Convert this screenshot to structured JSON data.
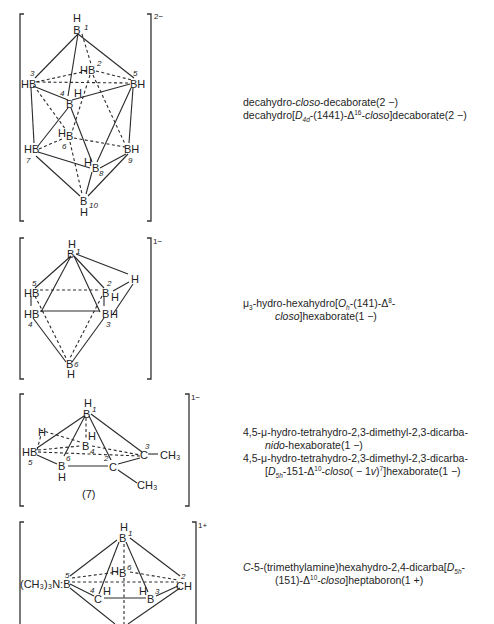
{
  "structures": [
    {
      "id": "decaborate",
      "charge": "2−",
      "atoms": {
        "b1": {
          "label": "B",
          "h": "H",
          "num": "1"
        },
        "b2": {
          "label": "B",
          "h": "H",
          "num": "2"
        },
        "b3": {
          "label": "HB",
          "num": "3"
        },
        "b4": {
          "label": "B",
          "h": "H",
          "num": "4"
        },
        "b5": {
          "label": "BH",
          "num": "5"
        },
        "b6": {
          "label": "B",
          "h": "H",
          "num": "6"
        },
        "b7": {
          "label": "HB",
          "num": "7"
        },
        "b8": {
          "label": "B",
          "h": "H",
          "num": "8"
        },
        "b9": {
          "label": "BH",
          "num": "9"
        },
        "b10": {
          "label": "B",
          "h": "H",
          "num": "10"
        }
      },
      "names": [
        {
          "parts": [
            {
              "t": "decahydro-"
            },
            {
              "t": "closo",
              "i": true
            },
            {
              "t": "-decaborate(2 −)"
            }
          ]
        },
        {
          "parts": [
            {
              "t": "decahydro["
            },
            {
              "t": "D",
              "i": true
            },
            {
              "t": "4d",
              "sub": true,
              "i": true
            },
            {
              "t": "-(1441)-Δ"
            },
            {
              "t": "16",
              "sup": true
            },
            {
              "t": "-"
            },
            {
              "t": "closo",
              "i": true
            },
            {
              "t": "]decaborate(2 −)"
            }
          ]
        }
      ]
    },
    {
      "id": "hexaborate",
      "charge": "1−",
      "atoms": {
        "b1": {
          "label": "B",
          "h": "H",
          "num": "1"
        },
        "b2": {
          "label": "B",
          "h": "H",
          "num": "2"
        },
        "b3": {
          "label": "B",
          "h": "H",
          "num": "3"
        },
        "b4": {
          "label": "HB",
          "num": "4"
        },
        "b5": {
          "label": "HB",
          "num": "5"
        },
        "b6": {
          "label": "B",
          "h": "H",
          "num": "6"
        },
        "mu_h": {
          "label": "H"
        }
      },
      "names": [
        {
          "parts": [
            {
              "t": "μ"
            },
            {
              "t": "3",
              "sub": true
            },
            {
              "t": "-hydro-hexahydro["
            },
            {
              "t": "O",
              "i": true
            },
            {
              "t": "h",
              "sub": true,
              "i": true
            },
            {
              "t": "-(141)-Δ"
            },
            {
              "t": "8",
              "sup": true
            },
            {
              "t": "-"
            }
          ]
        },
        {
          "parts": [
            {
              "t": "closo",
              "i": true
            },
            {
              "t": "]hexaborate(1 −)"
            }
          ]
        }
      ]
    },
    {
      "id": "dicarba-hexaborate",
      "charge": "1−",
      "caption": "(7)",
      "atoms": {
        "b1": {
          "label": "B",
          "h": "H",
          "num": "1"
        },
        "c2": {
          "label": "C",
          "num": "2",
          "sub": "CH₃"
        },
        "c3": {
          "label": "C",
          "num": "3",
          "sub": "CH₃"
        },
        "b4": {
          "label": "B",
          "h": "H",
          "num": "4"
        },
        "b5": {
          "label": "HB",
          "num": "5"
        },
        "b6": {
          "label": "B",
          "h": "H",
          "num": "6"
        },
        "mu_h": {
          "label": "H"
        }
      },
      "names": [
        {
          "parts": [
            {
              "t": "4,5-μ-hydro-tetrahydro-2,3-dimethyl-2,3-dicarba-"
            }
          ]
        },
        {
          "parts": [
            {
              "t": "nido",
              "i": true
            },
            {
              "t": "-hexaborate(1 −)"
            }
          ]
        },
        {
          "parts": [
            {
              "t": "4,5-μ-hydro-tetrahydro-2,3-dimethyl-2,3-dicarba-"
            }
          ]
        },
        {
          "parts": [
            {
              "t": "["
            },
            {
              "t": "D",
              "i": true
            },
            {
              "t": "5h",
              "sub": true,
              "i": true
            },
            {
              "t": "-151-Δ"
            },
            {
              "t": "10",
              "sup": true
            },
            {
              "t": "-"
            },
            {
              "t": "closo",
              "i": true
            },
            {
              "t": "( − 1"
            },
            {
              "t": "v",
              "i": true
            },
            {
              "t": ")"
            },
            {
              "t": "7",
              "sup": true
            },
            {
              "t": "]hexaborate(1 −)"
            }
          ]
        }
      ]
    },
    {
      "id": "heptaboron",
      "charge": "1+",
      "atoms": {
        "b1": {
          "label": "B",
          "h": "H",
          "num": "1"
        },
        "c2": {
          "label": "CH",
          "num": "2"
        },
        "b3": {
          "label": "B",
          "h": "H",
          "num": "3"
        },
        "c4": {
          "label": "C",
          "h": "H",
          "num": "4"
        },
        "b5": {
          "label": "(CH₃)₃N:B",
          "num": "5"
        },
        "b6": {
          "label": "B",
          "h": "H",
          "num": "6"
        },
        "b7": {
          "label": "B"
        }
      },
      "names": [
        {
          "parts": [
            {
              "t": "C",
              "i": true
            },
            {
              "t": "-5-(trimethylamine)hexahydro-2,4-dicarba["
            },
            {
              "t": "D",
              "i": true
            },
            {
              "t": "5h",
              "sub": true,
              "i": true
            },
            {
              "t": "-"
            }
          ]
        },
        {
          "parts": [
            {
              "t": "(151)-Δ"
            },
            {
              "t": "10",
              "sup": true
            },
            {
              "t": "-"
            },
            {
              "t": "closo",
              "i": true
            },
            {
              "t": "]heptaboron(1 +)"
            }
          ]
        }
      ]
    }
  ]
}
